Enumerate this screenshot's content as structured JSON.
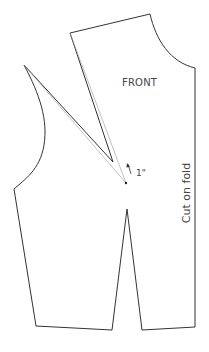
{
  "diagram": {
    "title": "FRONT",
    "fold_label": "Cut on fold",
    "dimension_label": "1\"",
    "colors": {
      "outline": "#333333",
      "guide": "#999999",
      "text": "#444444",
      "background": "#ffffff"
    },
    "pattern_piece": "bodice front with rotated bust dart",
    "points": {
      "shoulder_outer": [
        70,
        33
      ],
      "shoulder_neck": [
        150,
        14
      ],
      "center_front_neck": [
        195,
        68
      ],
      "center_front_hem": [
        195,
        327
      ],
      "hem_right_dart": [
        142,
        330
      ],
      "waist_dart_tip": [
        127,
        209
      ],
      "hem_left_dart": [
        112,
        330
      ],
      "side_hem": [
        36,
        326
      ],
      "side_armhole_low": [
        14,
        189
      ],
      "armhole_top": [
        24,
        65
      ],
      "bust_point": [
        126,
        183
      ],
      "shoulder_dart_tip": [
        115,
        163
      ]
    }
  }
}
